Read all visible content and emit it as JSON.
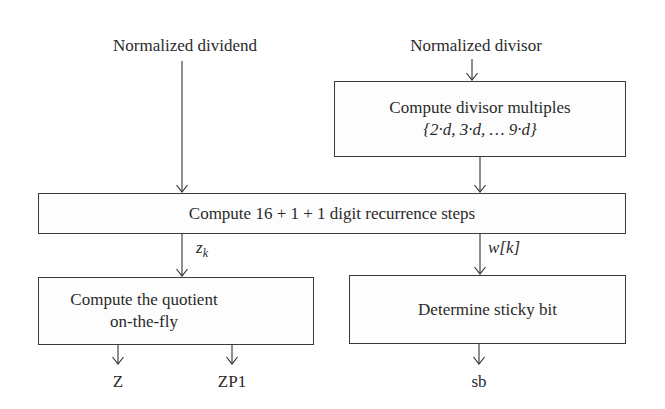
{
  "inputs": {
    "dividend": "Normalized dividend",
    "divisor": "Normalized divisor"
  },
  "boxes": {
    "divisor_multiples": {
      "line1": "Compute divisor multiples",
      "line2": "{2·d, 3·d, … 9·d}"
    },
    "recurrence": {
      "label": "Compute 16 + 1 + 1 digit recurrence steps"
    },
    "quotient": {
      "line1": "Compute the quotient",
      "line2": "on-the-fly"
    },
    "sticky": {
      "label": "Determine sticky bit"
    }
  },
  "edge_labels": {
    "zk": "z",
    "zk_sub": "k",
    "wk": "w[k]"
  },
  "outputs": {
    "z": "Z",
    "zp1": "ZP1",
    "sb": "sb"
  }
}
